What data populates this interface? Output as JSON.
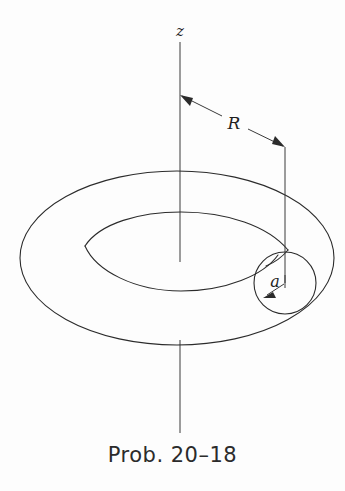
{
  "figure": {
    "title_caption": "Prob. 20–18",
    "background_color": "#fdfdfd",
    "ink_color": "#2b2b2b",
    "labels": {
      "axis_label": "z",
      "major_radius_label": "R",
      "minor_radius_label": "a"
    },
    "geometry": {
      "description": "torus viewed in oblique perspective with vertical symmetry axis",
      "axis_x": 180,
      "axis_top_y": 42,
      "axis_bottom_y": 433,
      "outer_ellipse": {
        "cx": 177,
        "cy": 258,
        "rx": 157,
        "ry": 87
      },
      "inner_ellipse": {
        "cx": 177,
        "cy": 262,
        "rx": 96,
        "ry": 38
      },
      "tube_circle": {
        "cx": 285,
        "cy": 283,
        "r": 31
      },
      "radius_line": {
        "x": 285,
        "y_top": 147,
        "y_bottom": 283
      },
      "R_arrow": {
        "x1": 180,
        "y1": 95,
        "x2": 285,
        "y2": 147
      },
      "a_arrow": {
        "x1": 285,
        "y1": 283,
        "x2": 264,
        "y2": 297
      }
    }
  }
}
